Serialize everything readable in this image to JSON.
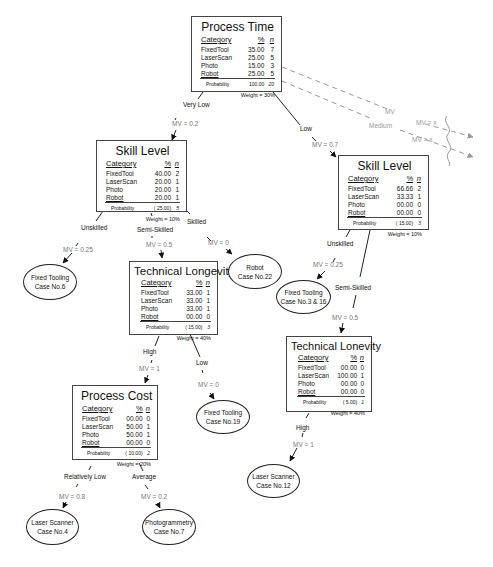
{
  "nodes": {
    "process_time": {
      "title": "Process Time",
      "headers": [
        "Category",
        "%",
        "n"
      ],
      "rows": [
        {
          "cat": "FixedTool",
          "pct": "35.00",
          "n": "7"
        },
        {
          "cat": "LaserScan",
          "pct": "25.00",
          "n": "5"
        },
        {
          "cat": "Photo",
          "pct": "15.00",
          "n": "3"
        },
        {
          "cat": "Robot",
          "pct": "25.00",
          "n": "5"
        }
      ],
      "probability_label": "Probability",
      "probability": "100.00",
      "total": "20",
      "weight": "Weight = 30%"
    },
    "skill_level_left": {
      "title": "Skill Level",
      "headers": [
        "Category",
        "%",
        "n"
      ],
      "rows": [
        {
          "cat": "FixedTool",
          "pct": "40.00",
          "n": "2"
        },
        {
          "cat": "LaserScan",
          "pct": "20.00",
          "n": "1"
        },
        {
          "cat": "Photo",
          "pct": "20.00",
          "n": "1"
        },
        {
          "cat": "Robot",
          "pct": "20.00",
          "n": "1"
        }
      ],
      "probability_label": "Probability",
      "probability": "( 25.00)",
      "total": "5",
      "weight": "Weight = 10%"
    },
    "skill_level_right": {
      "title": "Skill Level",
      "headers": [
        "Category",
        "%",
        "n"
      ],
      "rows": [
        {
          "cat": "FixedTool",
          "pct": "66.66",
          "n": "2"
        },
        {
          "cat": "LaserScan",
          "pct": "33.33",
          "n": "1"
        },
        {
          "cat": "Photo",
          "pct": "00.00",
          "n": "0"
        },
        {
          "cat": "Robot",
          "pct": "00.00",
          "n": "0"
        }
      ],
      "probability_label": "Probability",
      "probability": "( 15.00)",
      "total": "3",
      "weight": "Weight = 10%"
    },
    "technical_longevity": {
      "title": "Technical Longevity",
      "headers": [
        "Category",
        "%",
        "n"
      ],
      "rows": [
        {
          "cat": "FixedTool",
          "pct": "33.00",
          "n": "1"
        },
        {
          "cat": "LaserScan",
          "pct": "33.00",
          "n": "1"
        },
        {
          "cat": "Photo",
          "pct": "33.00",
          "n": "1"
        },
        {
          "cat": "Robot",
          "pct": "00.00",
          "n": "0"
        }
      ],
      "probability_label": "Probability",
      "probability": "( 15.00)",
      "total": "3",
      "weight": "Weight = 40%"
    },
    "technical_lonevity": {
      "title": "Technical Lonevity",
      "headers": [
        "Category",
        "%",
        "n"
      ],
      "rows": [
        {
          "cat": "FixedTool",
          "pct": "00.00",
          "n": "0"
        },
        {
          "cat": "LaserScan",
          "pct": "100.00",
          "n": "1"
        },
        {
          "cat": "Photo",
          "pct": "00.00",
          "n": "0"
        },
        {
          "cat": "Robot",
          "pct": "00.00",
          "n": "0"
        }
      ],
      "probability_label": "Probability",
      "probability": "( 5.00)",
      "total": "1",
      "weight": "Weight = 40%"
    },
    "process_cost": {
      "title": "Process Cost",
      "headers": [
        "Category",
        "%",
        "n"
      ],
      "rows": [
        {
          "cat": "FixedTool",
          "pct": "00.00",
          "n": "0"
        },
        {
          "cat": "LaserScan",
          "pct": "50.00",
          "n": "1"
        },
        {
          "cat": "Photo",
          "pct": "50.00",
          "n": "1"
        },
        {
          "cat": "Robot",
          "pct": "00.00",
          "n": "0"
        }
      ],
      "probability_label": "Probability",
      "probability": "( 10.00)",
      "total": "2",
      "weight": "Weight = 20%"
    }
  },
  "leaves": {
    "fixed_tooling_6": {
      "line1": "Fixed Tooling",
      "line2": "Case No.6"
    },
    "robot_22": {
      "line1": "Robot",
      "line2": "Case No.22"
    },
    "fixed_tooling_3_16": {
      "line1": "Fixed Tooling",
      "line2": "Case No.3 & 16"
    },
    "fixed_tooling_19": {
      "line1": "Fixed Tooling",
      "line2": "Case No.19"
    },
    "laser_scanner_12": {
      "line1": "Laser Scanner",
      "line2": "Case No.12"
    },
    "laser_scanner_4": {
      "line1": "Laser Scanner",
      "line2": "Case No.4"
    },
    "photogrammetry_7": {
      "line1": "Photogrammetry",
      "line2": "Case No.7"
    }
  },
  "edges": {
    "very_low": {
      "label": "Very Low",
      "mv": "MV = 0.2"
    },
    "low_top": {
      "label": "Low",
      "mv": "MV = 0.7"
    },
    "medium": {
      "label": "Medium",
      "mv": "MV = x"
    },
    "mv_other": {
      "label": "MV",
      "mv": "MV = x"
    },
    "unskilled_left": {
      "label": "Unskilled",
      "mv": "MV = 0.25"
    },
    "semi_skilled_left": {
      "label": "Semi-Skilled",
      "mv": "MV = 0.5"
    },
    "skilled_left": {
      "label": "Skilled",
      "mv": "MV = 0"
    },
    "unskilled_right": {
      "label": "Unskilled",
      "mv": "MV = 0.25"
    },
    "semi_skilled_right": {
      "label": "Semi-Skilled",
      "mv": "MV = 0.5"
    },
    "high_left": {
      "label": "High",
      "mv": "MV = 1"
    },
    "low_left": {
      "label": "Low",
      "mv": "MV = 0"
    },
    "high_right": {
      "label": "High",
      "mv": "MV = 1"
    },
    "relatively_low": {
      "label": "Relatively Low",
      "mv": "MV = 0.8"
    },
    "average": {
      "label": "Average",
      "mv": "MV = 0.2"
    }
  }
}
